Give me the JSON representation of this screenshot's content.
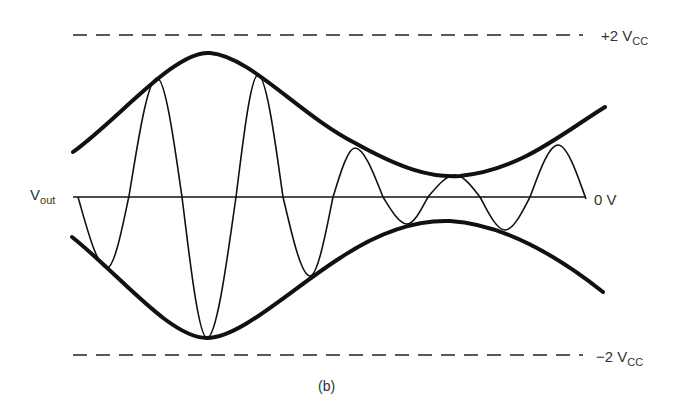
{
  "figure": {
    "caption": "(b)",
    "colors": {
      "background": "#ffffff",
      "stroke": "#111111",
      "text": "#333333"
    }
  },
  "labels": {
    "top_rail": {
      "main": "+2 V",
      "sub": "CC"
    },
    "zero": {
      "main": "0 V"
    },
    "bottom_rail": {
      "main": "−2 V",
      "sub": "CC"
    },
    "signal": {
      "main": "V",
      "sub": "out"
    }
  },
  "geometry": {
    "top_dashed_y": 35,
    "bottom_dashed_y": 355,
    "dashed_x_range": [
      73,
      583
    ],
    "dash_pattern": [
      14,
      9
    ],
    "zero_axis": {
      "y": 197,
      "x_range": [
        73,
        586
      ]
    },
    "upper_envelope": "M73,152 C120,118 175,50 210,53 C250,56 300,115 355,143 C400,168 430,178 460,176 C520,170 560,135 605,107",
    "lower_envelope": "M72,237 C120,275 170,338 207,338 C240,338 290,290 340,258 C385,228 420,220 450,221 C500,224 550,250 603,292",
    "waveform_points": [
      [
        78,
        197
      ],
      [
        107,
        268
      ],
      [
        129,
        196
      ],
      [
        157,
        78
      ],
      [
        182,
        197
      ],
      [
        207,
        338
      ],
      [
        236,
        197
      ],
      [
        258,
        75
      ],
      [
        283,
        197
      ],
      [
        310,
        276
      ],
      [
        333,
        197
      ],
      [
        355,
        148
      ],
      [
        383,
        197
      ],
      [
        407,
        224
      ],
      [
        428,
        197
      ],
      [
        455,
        175
      ],
      [
        480,
        197
      ],
      [
        505,
        230
      ],
      [
        530,
        197
      ],
      [
        558,
        145
      ],
      [
        586,
        199
      ]
    ]
  }
}
